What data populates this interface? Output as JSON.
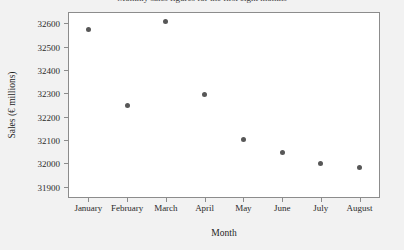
{
  "chart_data": {
    "type": "scatter",
    "title": "Monthly sales figures for the first eight months",
    "xlabel": "Month",
    "ylabel": "Sales (€ millions)",
    "categories": [
      "January",
      "February",
      "March",
      "April",
      "May",
      "June",
      "July",
      "August"
    ],
    "values": [
      32573,
      32247,
      32610,
      32297,
      32100,
      32048,
      31998,
      31982
    ],
    "series": [
      {
        "name": "Sales",
        "values": [
          32573,
          32247,
          32610,
          32297,
          32100,
          32048,
          31998,
          31982
        ]
      }
    ],
    "ylim": [
      31855,
      32645
    ],
    "yticks": [
      31900,
      32000,
      32100,
      32200,
      32300,
      32400,
      32500,
      32600
    ],
    "ytick_labels": [
      "31900",
      "32000",
      "32100",
      "32200",
      "32300",
      "32400",
      "32500",
      "32600"
    ],
    "grid": false,
    "legend": false,
    "marker_color": "#575757",
    "frame_color": "#8c8c8c",
    "plot_background": "#ffffff",
    "page_background": "#f2f2f2"
  }
}
